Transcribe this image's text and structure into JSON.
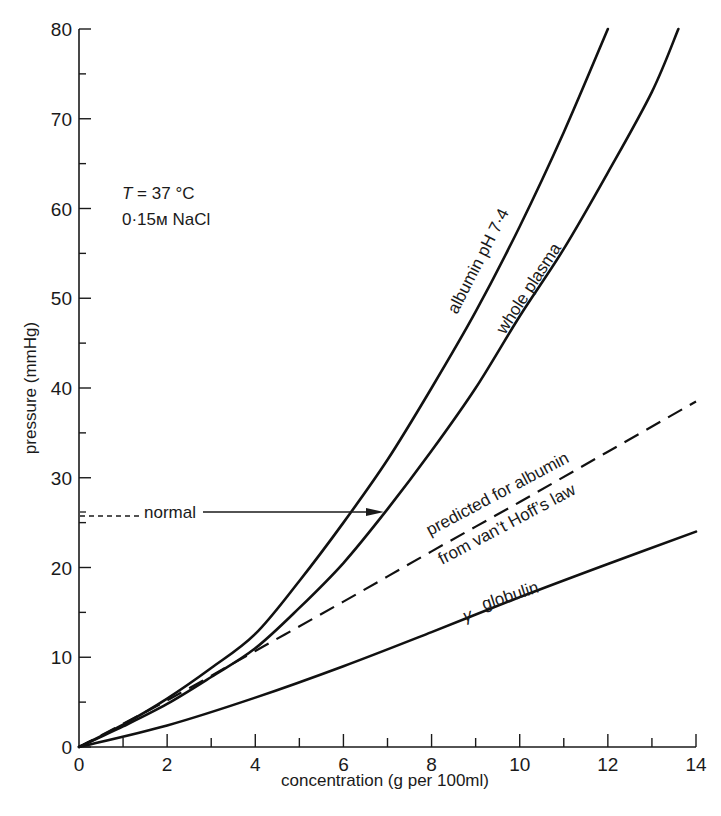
{
  "chart_data": {
    "type": "line",
    "title": "",
    "xlabel": "concentration (g per 100ml)",
    "ylabel": "pressure (mmHg)",
    "xlim": [
      0,
      14
    ],
    "ylim": [
      0,
      80
    ],
    "x_ticks": [
      0,
      2,
      4,
      6,
      8,
      10,
      12,
      14
    ],
    "y_ticks": [
      0,
      10,
      20,
      30,
      40,
      50,
      60,
      70,
      80
    ],
    "grid": false,
    "legend": "none (curves labelled directly)",
    "series": [
      {
        "name": "albumin pH 7·4",
        "style": "solid",
        "x": [
          0,
          1,
          2,
          3,
          4,
          5,
          6,
          7,
          8,
          9,
          10,
          11,
          12
        ],
        "y": [
          0,
          2.5,
          5.4,
          8.8,
          12.6,
          18.5,
          25,
          32,
          40,
          48.5,
          58,
          68.5,
          80
        ]
      },
      {
        "name": "whole plasma",
        "style": "solid",
        "x": [
          0,
          1,
          2,
          3,
          4,
          5,
          6,
          7,
          8,
          9,
          10,
          11,
          12,
          13,
          13.6
        ],
        "y": [
          0,
          2.3,
          4.8,
          7.8,
          11,
          15.5,
          20.5,
          26.5,
          33,
          40,
          48,
          55.5,
          64,
          73,
          80
        ]
      },
      {
        "name": "predicted for albumin from van't Hoff's law",
        "style": "dashed",
        "x": [
          0,
          2,
          4,
          6,
          8,
          10,
          12,
          14
        ],
        "y": [
          0,
          5.2,
          10.7,
          16.2,
          21.8,
          27.3,
          32.9,
          38.5
        ]
      },
      {
        "name": "γ globulin",
        "style": "solid",
        "x": [
          0,
          2,
          4,
          6,
          8,
          10,
          12,
          14
        ],
        "y": [
          0,
          2.4,
          5.5,
          9,
          12.8,
          16.7,
          20.4,
          24
        ]
      }
    ],
    "annotations": [
      {
        "text": "T = 37 °C",
        "x": 2,
        "y": 63
      },
      {
        "text": "0·15M NaCl",
        "x": 2,
        "y": 59
      },
      {
        "text": "normal",
        "y": 25.7,
        "arrow_from_x": 0,
        "arrow_to_x": 6.85,
        "note": "dashed to label, arrow to whole plasma curve"
      }
    ]
  },
  "labels": {
    "ylabel": "pressure (mmHg)",
    "xlabel": "concentration (g per 100ml)",
    "cond1_t": "T",
    "cond1_rest": " = 37 °C",
    "cond2": "0·15м NaCl",
    "normal": "normal",
    "albumin": "albumin pH 7·4",
    "plasma": "whole  plasma",
    "vanthoff1": "predicted for albumin",
    "vanthoff2": "from van’t Hoff’s law",
    "gamma": "γ",
    "globulin": "globulin"
  },
  "x_tick_labels": [
    "0",
    "2",
    "4",
    "6",
    "8",
    "10",
    "12",
    "14"
  ],
  "y_tick_labels": [
    "0",
    "10",
    "20",
    "30",
    "40",
    "50",
    "60",
    "70",
    "80"
  ]
}
